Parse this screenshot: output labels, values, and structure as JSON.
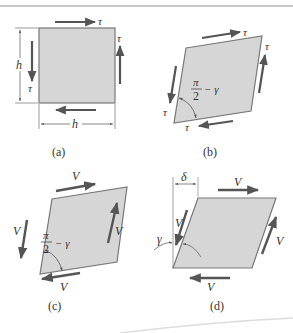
{
  "figure": {
    "colors": {
      "fill": "#d6d6d6",
      "edge": "#777777",
      "arrow": "#555555",
      "dimension": "#555555",
      "text": "#333333",
      "top_rule": "#c8c8c8"
    },
    "panels": [
      {
        "id": "a",
        "caption": "(a)",
        "shape": "square",
        "labels": {
          "top_force": "τ",
          "right_force": "τ",
          "left_force": "τ",
          "height_dim": "h",
          "width_dim": "h"
        }
      },
      {
        "id": "b",
        "caption": "(b)",
        "shape": "parallelogram",
        "labels": {
          "top_force": "τ",
          "right_force": "τ",
          "left_force": "τ",
          "bottom_force": "τ",
          "angle_num": "π",
          "angle_den": "2",
          "angle_rest": "− γ"
        }
      },
      {
        "id": "c",
        "caption": "(c)",
        "shape": "parallelogram",
        "labels": {
          "top_force": "V",
          "right_force": "V",
          "left_force": "V",
          "bottom_force": "V",
          "angle_num": "π",
          "angle_den": "2",
          "angle_rest": "− γ"
        }
      },
      {
        "id": "d",
        "caption": "(d)",
        "shape": "parallelogram",
        "labels": {
          "top_force": "V",
          "right_force": "V",
          "left_force": "V",
          "bottom_force": "V",
          "displacement": "δ",
          "shear_angle": "γ"
        }
      }
    ]
  }
}
